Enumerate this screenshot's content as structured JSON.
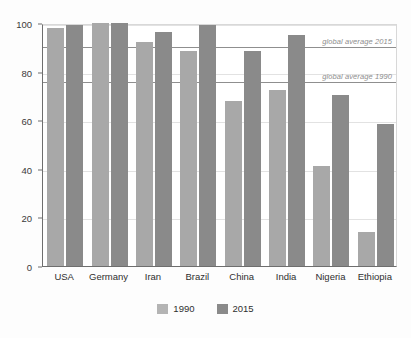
{
  "chart_data": {
    "type": "bar",
    "title": "",
    "subtitle": "",
    "xlabel": "",
    "ylabel": "",
    "ylim": [
      0,
      100
    ],
    "yticks": [
      0,
      20,
      40,
      60,
      80,
      100
    ],
    "ytick_labels": [
      "0",
      "20",
      "40",
      "60",
      "80",
      "100"
    ],
    "grid": true,
    "legend_position": "bottom-center",
    "categories": [
      "USA",
      "Germany",
      "Iran",
      "Brazil",
      "China",
      "India",
      "Nigeria",
      "Ethiopia"
    ],
    "series": [
      {
        "name": "1990",
        "color": "#a8a8a8",
        "values": [
          98,
          100,
          92,
          88.5,
          68,
          72.5,
          41,
          14
        ]
      },
      {
        "name": "2015",
        "color": "#8a8a8a",
        "values": [
          99,
          100,
          96.5,
          99,
          88.5,
          95,
          70.5,
          58.5
        ]
      }
    ],
    "reference_lines": [
      {
        "label": "global average 2015",
        "value": 91,
        "color": "#8f8f8f"
      },
      {
        "label": "global average 1990",
        "value": 76.5,
        "color": "#8f8f8f"
      }
    ]
  }
}
